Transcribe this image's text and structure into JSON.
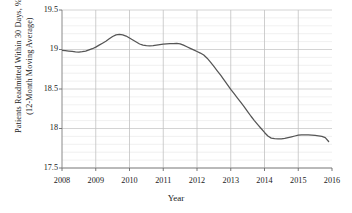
{
  "chart_data": {
    "type": "line",
    "title": "",
    "xlabel": "Year",
    "ylabel": "Patients Readmitted Within 30 Days, %",
    "ylabel_line2": "(12-Month Moving Average)",
    "xlim": [
      2008,
      2016
    ],
    "ylim": [
      17.5,
      19.5
    ],
    "xticks": [
      "2008",
      "2009",
      "2010",
      "2011",
      "2012",
      "2013",
      "2014",
      "2015",
      "2016"
    ],
    "xtick_values": [
      2008,
      2009,
      2010,
      2011,
      2012,
      2013,
      2014,
      2015,
      2016
    ],
    "yticks": [
      "19.5",
      "19",
      "18.5",
      "18",
      "17.5"
    ],
    "ytick_values": [
      19.5,
      19,
      18.5,
      18,
      17.5
    ],
    "grid": "minor horizontal gridlines every 0.1; vertical gridlines at each year",
    "legend": "none",
    "line_color": "#555555",
    "series": [
      {
        "name": "Patients Readmitted Within 30 Days, % (12-Month Moving Average)",
        "x": [
          2008.0,
          2008.1,
          2008.2,
          2008.3,
          2008.4,
          2008.5,
          2008.6,
          2008.7,
          2008.8,
          2008.9,
          2009.0,
          2009.1,
          2009.2,
          2009.3,
          2009.4,
          2009.5,
          2009.6,
          2009.7,
          2009.8,
          2009.9,
          2010.0,
          2010.1,
          2010.2,
          2010.3,
          2010.4,
          2010.5,
          2010.6,
          2010.7,
          2010.8,
          2010.9,
          2011.0,
          2011.1,
          2011.2,
          2011.3,
          2011.4,
          2011.5,
          2011.6,
          2011.7,
          2011.8,
          2011.9,
          2012.0,
          2012.1,
          2012.2,
          2012.3,
          2012.4,
          2012.5,
          2012.6,
          2012.7,
          2012.8,
          2012.9,
          2013.0,
          2013.1,
          2013.2,
          2013.3,
          2013.4,
          2013.5,
          2013.6,
          2013.7,
          2013.8,
          2013.9,
          2014.0,
          2014.1,
          2014.2,
          2014.3,
          2014.4,
          2014.5,
          2014.6,
          2014.7,
          2014.8,
          2014.9,
          2015.0,
          2015.1,
          2015.2,
          2015.3,
          2015.4,
          2015.5,
          2015.6,
          2015.7,
          2015.8,
          2015.9
        ],
        "values": [
          18.99,
          18.985,
          18.98,
          18.975,
          18.97,
          18.968,
          18.972,
          18.98,
          18.995,
          19.01,
          19.03,
          19.055,
          19.08,
          19.105,
          19.135,
          19.165,
          19.185,
          19.19,
          19.185,
          19.17,
          19.145,
          19.12,
          19.095,
          19.07,
          19.055,
          19.048,
          19.045,
          19.048,
          19.055,
          19.062,
          19.068,
          19.072,
          19.074,
          19.075,
          19.078,
          19.072,
          19.055,
          19.035,
          19.015,
          18.995,
          18.975,
          18.955,
          18.93,
          18.89,
          18.84,
          18.785,
          18.73,
          18.675,
          18.615,
          18.555,
          18.495,
          18.44,
          18.385,
          18.33,
          18.275,
          18.215,
          18.155,
          18.1,
          18.05,
          18.0,
          17.95,
          17.905,
          17.878,
          17.872,
          17.87,
          17.87,
          17.875,
          17.885,
          17.895,
          17.905,
          17.915,
          17.92,
          17.92,
          17.918,
          17.915,
          17.912,
          17.908,
          17.9,
          17.885,
          17.835
        ]
      }
    ]
  },
  "axes": {
    "x_title": "Year"
  }
}
